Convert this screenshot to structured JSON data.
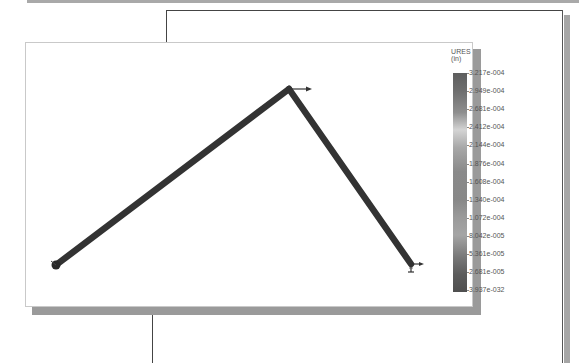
{
  "legend": {
    "title": "URES (in)",
    "labels": [
      "3.217e-004",
      "2.949e-004",
      "2.681e-004",
      "2.412e-004",
      "2.144e-004",
      "1.876e-004",
      "1.608e-004",
      "1.340e-004",
      "1.072e-004",
      "8.042e-005",
      "5.361e-005",
      "2.681e-005",
      "3.937e-032"
    ]
  },
  "model": {
    "nodes": [
      {
        "id": "left-support",
        "x": 56,
        "y": 265
      },
      {
        "id": "apex",
        "x": 289,
        "y": 89
      },
      {
        "id": "right-support",
        "x": 411,
        "y": 264
      }
    ],
    "members": [
      {
        "from": "left-support",
        "to": "apex"
      },
      {
        "from": "apex",
        "to": "right-support"
      }
    ],
    "member_color": "#333333",
    "load_arrow": {
      "at": "apex",
      "direction": "right"
    }
  }
}
